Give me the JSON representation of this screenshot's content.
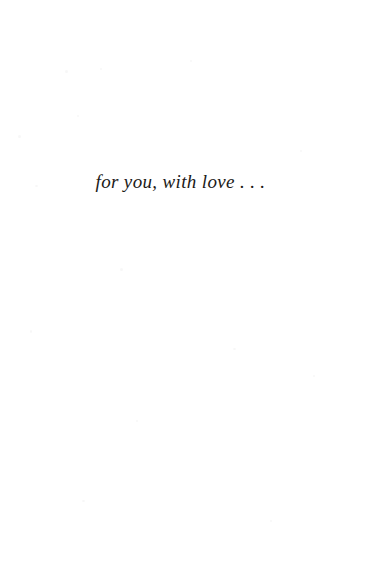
{
  "page": {
    "kind": "book-dedication-page",
    "background_color": "#ffffff",
    "width": 379,
    "height": 580
  },
  "dedication": {
    "text": "for you, with love . . .",
    "style": "italic-serif",
    "text_color": "#1c1a18",
    "alignment": "center"
  }
}
